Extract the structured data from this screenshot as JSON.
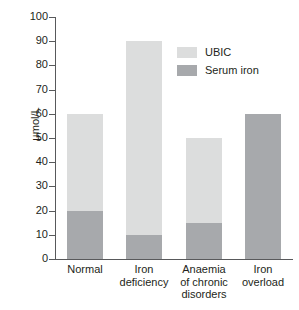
{
  "chart_data": {
    "type": "bar",
    "subtype": "stacked-bar",
    "title": "",
    "xlabel": "",
    "ylabel": "µmol/L",
    "ylim": [
      0,
      100
    ],
    "yticks": [
      0,
      10,
      20,
      30,
      40,
      50,
      60,
      70,
      80,
      90,
      100
    ],
    "ytick_labels": [
      "0",
      "10",
      "20",
      "30",
      "40",
      "50",
      "60",
      "70",
      "80",
      "90",
      "100"
    ],
    "grid": false,
    "legend_position": "upper right (inside plot area)",
    "categories": [
      "Normal",
      "Iron deficiency",
      "Anaemia of chronic disorders",
      "Iron overload"
    ],
    "category_label_lines": [
      [
        "Normal"
      ],
      [
        "Iron",
        "deficiency"
      ],
      [
        "Anaemia",
        "of chronic",
        "disorders"
      ],
      [
        "Iron",
        "overload"
      ]
    ],
    "series": [
      {
        "name": "Serum iron",
        "color": "#a7a9ac",
        "values": [
          20,
          10,
          15,
          60
        ]
      },
      {
        "name": "UBIC",
        "color": "#dcdddd",
        "values": [
          40,
          80,
          35,
          0
        ]
      }
    ],
    "totals": [
      60,
      90,
      50,
      60
    ],
    "stack_order_bottom_to_top": [
      "Serum iron",
      "UBIC"
    ]
  },
  "legend": {
    "items": [
      {
        "label": "UBIC",
        "color": "#dcdddd"
      },
      {
        "label": "Serum iron",
        "color": "#a7a9ac"
      }
    ]
  },
  "axes": {
    "y_label": "µmol/L",
    "y_tick_labels": [
      "100",
      "90",
      "80",
      "70",
      "60",
      "50",
      "40",
      "30",
      "20",
      "10",
      "0"
    ],
    "axis_color": "#58595b"
  }
}
